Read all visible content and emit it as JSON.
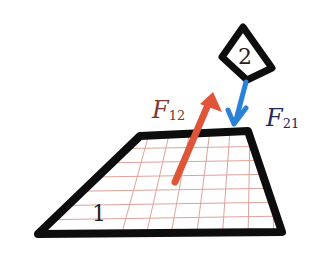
{
  "diagram": {
    "objects": [
      {
        "id": "1",
        "label": "1",
        "shape": "trapezoid",
        "fill": "grid"
      },
      {
        "id": "2",
        "label": "2",
        "shape": "quadrilateral"
      }
    ],
    "forces": [
      {
        "symbol": "F",
        "subscript": "12",
        "color": "#e0553a",
        "direction": "up-right",
        "acts_on": "2"
      },
      {
        "symbol": "F",
        "subscript": "21",
        "color": "#2a82d6",
        "direction": "down",
        "acts_on": "1"
      }
    ],
    "colors": {
      "outline": "#0d0d0d",
      "grid": "#d9938a",
      "f12": "#e0553a",
      "f12_label": "#7a3a2e",
      "f21": "#2a82d6",
      "f21_label": "#1f2a5a"
    }
  }
}
